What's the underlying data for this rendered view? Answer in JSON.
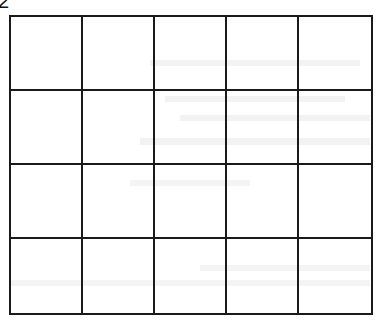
{
  "document": {
    "label": "2",
    "grid": {
      "columns": 5,
      "rows": 4,
      "cells": [
        [
          "",
          "",
          "",
          "",
          ""
        ],
        [
          "",
          "",
          "",
          "",
          ""
        ],
        [
          "",
          "",
          "",
          "",
          ""
        ],
        [
          "",
          "",
          "",
          "",
          ""
        ]
      ]
    },
    "colors": {
      "line": "#1a1a1a",
      "background": "#ffffff"
    }
  }
}
